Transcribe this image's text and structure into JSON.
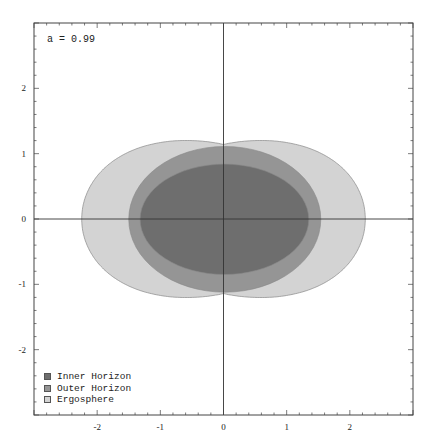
{
  "chart_data": {
    "type": "area",
    "title": "",
    "annotation": "a = 0.99",
    "xlabel": "",
    "ylabel": "",
    "xlim": [
      -3,
      3
    ],
    "ylim": [
      -3,
      3
    ],
    "x_ticks": [
      -2,
      -1,
      0,
      1,
      2
    ],
    "y_ticks": [
      -2,
      -1,
      0,
      1,
      2
    ],
    "x_tick_labels": [
      "-2",
      "-1",
      "0",
      "1",
      "2"
    ],
    "y_tick_labels": [
      "-2",
      "-1",
      "0",
      "1",
      "2"
    ],
    "grid": false,
    "axes_through_origin": true,
    "legend_position": "lower-left",
    "series": [
      {
        "name": "Ergosphere",
        "color": "#d3d3d3",
        "shape": "peanut",
        "x_extent": [
          -2.22,
          2.27
        ],
        "y_extent": [
          -1.31,
          1.28
        ],
        "waist_y_at_x0": 1.14
      },
      {
        "name": "Outer Horizon",
        "color": "#959595",
        "shape": "ellipse",
        "x_extent": [
          -1.5,
          1.54
        ],
        "y_extent": [
          -1.12,
          1.11
        ]
      },
      {
        "name": "Inner Horizon",
        "color": "#6e6e6e",
        "shape": "ellipse",
        "x_extent": [
          -1.32,
          1.35
        ],
        "y_extent": [
          -0.85,
          0.84
        ]
      }
    ]
  },
  "legend": {
    "items": [
      {
        "label": "Inner Horizon",
        "color": "#6e6e6e"
      },
      {
        "label": "Outer Horizon",
        "color": "#959595"
      },
      {
        "label": "Ergosphere",
        "color": "#d3d3d3"
      }
    ]
  }
}
